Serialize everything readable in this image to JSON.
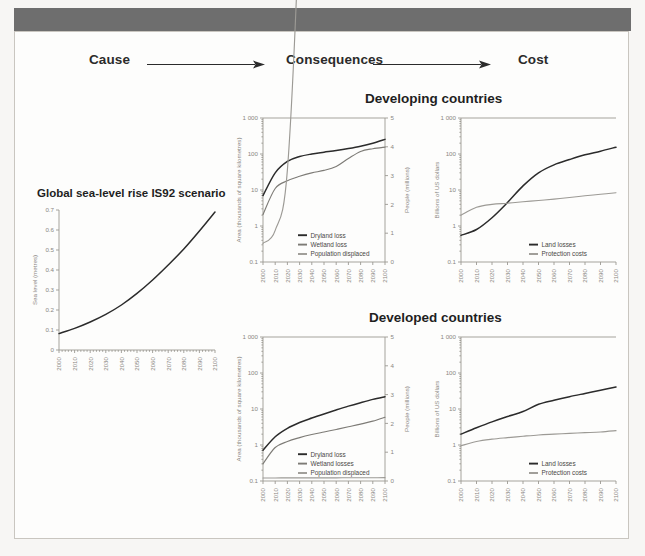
{
  "flow": {
    "cause_label": "Cause",
    "consequences_label": "Consequences",
    "cost_label": "Cost",
    "arrow_icon": "arrow-right-icon"
  },
  "sections": {
    "developing_label": "Developing countries",
    "developed_label": "Developed countries"
  },
  "colors": {
    "dryland": "#2b2b2b",
    "wetland": "#7d7b76",
    "population": "#9c9a95",
    "land_losses": "#2b2b2b",
    "protection_costs": "#9c9a95",
    "sea_level": "#2b2b2b",
    "axis": "#9b9892",
    "band": "#6e6e6e"
  },
  "chart_data": [
    {
      "id": "sea-level",
      "type": "line",
      "title": "Global sea-level rise IS92 scenario",
      "xlabel": "",
      "ylabel": "Sea level (metres)",
      "yscale": "linear",
      "ylim": [
        0,
        0.7
      ],
      "yticks": [
        0,
        0.1,
        0.2,
        0.3,
        0.4,
        0.5,
        0.6,
        0.7
      ],
      "ytick_labels": [
        "0",
        "0.1",
        "0.2",
        "0.3",
        "0.4",
        "0.5",
        "0.6",
        "0.7"
      ],
      "x": [
        2000,
        2010,
        2020,
        2030,
        2040,
        2050,
        2060,
        2070,
        2080,
        2090,
        2100
      ],
      "xtick_labels": [
        "2000",
        "2010",
        "2020",
        "2030",
        "2040",
        "2050",
        "2060",
        "2070",
        "2080",
        "2090",
        "2100"
      ],
      "grid": false,
      "legend": null,
      "series": [
        {
          "name": "Sea level",
          "color": "#2b2b2b",
          "values": [
            0.082,
            0.108,
            0.14,
            0.178,
            0.225,
            0.283,
            0.35,
            0.425,
            0.505,
            0.595,
            0.69
          ]
        }
      ]
    },
    {
      "id": "developing-area",
      "type": "line",
      "title": "",
      "ylabel": "Area (thousands of square kilometres)",
      "ylabel_right": "People (millions)",
      "yscale": "log",
      "ylim": [
        0.1,
        1000
      ],
      "ytick_labels": [
        "0.1",
        "1",
        "10",
        "100",
        "1 000"
      ],
      "yticks_right": [
        0,
        1,
        2,
        3,
        4,
        5
      ],
      "ytick_labels_right": [
        "0",
        "1",
        "2",
        "3",
        "4",
        "5"
      ],
      "x": [
        2000,
        2010,
        2020,
        2030,
        2040,
        2050,
        2060,
        2070,
        2080,
        2090,
        2100
      ],
      "xtick_labels": [
        "2000",
        "2010",
        "2020",
        "2030",
        "2040",
        "2050",
        "2060",
        "2070",
        "2080",
        "2090",
        "2100"
      ],
      "grid": false,
      "legend_position": "bottom-right",
      "series": [
        {
          "name": "Dryland loss",
          "color": "#2b2b2b",
          "axis": "left",
          "values": [
            7.0,
            30.0,
            62.0,
            85.0,
            100.0,
            112.0,
            125.0,
            142.0,
            165.0,
            200.0,
            255.0
          ]
        },
        {
          "name": "Wetland loss",
          "color": "#7d7b76",
          "axis": "left",
          "values": [
            2.1,
            11.0,
            18.0,
            24.0,
            30.0,
            35.0,
            45.0,
            75.0,
            118.0,
            140.0,
            155.0
          ]
        },
        {
          "name": "Population displaced",
          "color": "#9c9a95",
          "axis": "right",
          "values": [
            0.65,
            1.1,
            3.2,
            12.0,
            26.0,
            34.0,
            40.0,
            50.0,
            60.0,
            70.0,
            80.0
          ]
        }
      ]
    },
    {
      "id": "developing-cost",
      "type": "line",
      "title": "",
      "ylabel": "Billions of US dollars",
      "yscale": "log",
      "ylim": [
        0.1,
        1000
      ],
      "ytick_labels": [
        "0.1",
        "1",
        "10",
        "100",
        "1 000"
      ],
      "x": [
        2000,
        2010,
        2020,
        2030,
        2040,
        2050,
        2060,
        2070,
        2080,
        2090,
        2100
      ],
      "xtick_labels": [
        "2000",
        "2010",
        "2020",
        "2030",
        "2040",
        "2050",
        "2060",
        "2070",
        "2080",
        "2090",
        "2100"
      ],
      "grid": false,
      "legend_position": "bottom-right",
      "series": [
        {
          "name": "Land losses",
          "color": "#2b2b2b",
          "values": [
            0.55,
            0.8,
            1.7,
            4.5,
            13.0,
            30.0,
            50.0,
            70.0,
            95.0,
            120.0,
            155.0
          ]
        },
        {
          "name": "Protection costs",
          "color": "#9c9a95",
          "values": [
            2.0,
            3.3,
            4.0,
            4.3,
            4.7,
            5.1,
            5.6,
            6.2,
            6.9,
            7.6,
            8.4
          ]
        }
      ]
    },
    {
      "id": "developed-area",
      "type": "line",
      "title": "",
      "ylabel": "Area (thousands of square kilometres)",
      "ylabel_right": "People (millions)",
      "yscale": "log",
      "ylim": [
        0.1,
        1000
      ],
      "ytick_labels": [
        "0.1",
        "1",
        "10",
        "100",
        "1 000"
      ],
      "yticks_right": [
        0,
        1,
        2,
        3,
        4,
        5
      ],
      "ytick_labels_right": [
        "0",
        "1",
        "2",
        "3",
        "4",
        "5"
      ],
      "x": [
        2000,
        2010,
        2020,
        2030,
        2040,
        2050,
        2060,
        2070,
        2080,
        2090,
        2100
      ],
      "xtick_labels": [
        "2000",
        "2010",
        "2020",
        "2030",
        "2040",
        "2050",
        "2060",
        "2070",
        "2080",
        "2090",
        "2100"
      ],
      "grid": false,
      "legend_position": "bottom-right",
      "series": [
        {
          "name": "Dryland loss",
          "color": "#2b2b2b",
          "axis": "left",
          "values": [
            0.72,
            1.7,
            2.9,
            4.2,
            5.6,
            7.3,
            9.4,
            12.0,
            15.0,
            18.5,
            22.0
          ]
        },
        {
          "name": "Wetland losses",
          "color": "#7d7b76",
          "axis": "left",
          "values": [
            0.3,
            0.85,
            1.25,
            1.6,
            1.95,
            2.3,
            2.7,
            3.2,
            3.8,
            4.6,
            5.9
          ]
        },
        {
          "name": "Population displaced",
          "color": "#9c9a95",
          "axis": "right",
          "values": [
            0.105,
            0.106,
            0.107,
            0.108,
            0.109,
            0.11,
            0.111,
            0.112,
            0.113,
            0.114,
            0.115
          ]
        }
      ]
    },
    {
      "id": "developed-cost",
      "type": "line",
      "title": "",
      "ylabel": "Billions of US dollars",
      "yscale": "log",
      "ylim": [
        0.1,
        1000
      ],
      "ytick_labels": [
        "0.1",
        "1",
        "10",
        "100",
        "1 000"
      ],
      "x": [
        2000,
        2010,
        2020,
        2030,
        2040,
        2050,
        2060,
        2070,
        2080,
        2090,
        2100
      ],
      "xtick_labels": [
        "2000",
        "2010",
        "2020",
        "2030",
        "2040",
        "2050",
        "2060",
        "2070",
        "2080",
        "2090",
        "2100"
      ],
      "grid": false,
      "legend_position": "bottom-right",
      "series": [
        {
          "name": "Land losses",
          "color": "#2b2b2b",
          "values": [
            2.0,
            3.0,
            4.4,
            6.2,
            8.5,
            13.5,
            17.5,
            22.0,
            27.0,
            33.0,
            41.0
          ]
        },
        {
          "name": "Protection costs",
          "color": "#9c9a95",
          "values": [
            0.95,
            1.25,
            1.45,
            1.6,
            1.75,
            1.9,
            2.0,
            2.1,
            2.2,
            2.3,
            2.5
          ]
        }
      ]
    }
  ]
}
